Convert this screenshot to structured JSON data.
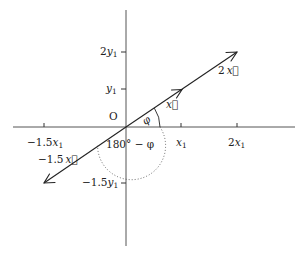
{
  "diagram": {
    "origin_label": "O",
    "x_ticks": [
      {
        "label_coef": "−1.5",
        "label_var": "x",
        "label_sub": "1",
        "value": -1.5
      },
      {
        "label_coef": "",
        "label_var": "x",
        "label_sub": "1",
        "value": 1
      },
      {
        "label_coef": "2",
        "label_var": "x",
        "label_sub": "1",
        "value": 2
      }
    ],
    "y_ticks": [
      {
        "label_coef": "2",
        "label_var": "y",
        "label_sub": "1",
        "value": 2
      },
      {
        "label_coef": "",
        "label_var": "y",
        "label_sub": "1",
        "value": 1
      },
      {
        "label_coef": "−1.5",
        "label_var": "y",
        "label_sub": "1",
        "value": -1.5
      }
    ],
    "vectors": [
      {
        "name": "x",
        "label_coef": "",
        "label_var": "x⃗",
        "scale": 1
      },
      {
        "name": "2x",
        "label_coef": "2",
        "label_var": "x⃗",
        "scale": 2
      },
      {
        "name": "-1.5x",
        "label_coef": "−1.5",
        "label_var": "x⃗",
        "scale": -1.5
      }
    ],
    "angles": {
      "phi_label": "φ",
      "supplement_label": "180° − φ"
    }
  }
}
